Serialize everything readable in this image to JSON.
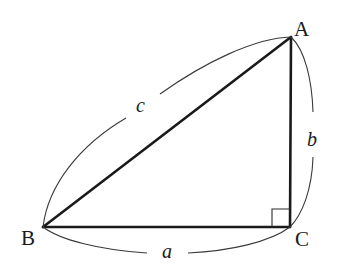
{
  "diagram": {
    "vertices": [
      {
        "id": "A",
        "label": "A",
        "x": 291,
        "y": 37
      },
      {
        "id": "B",
        "label": "B",
        "x": 43,
        "y": 227
      },
      {
        "id": "C",
        "label": "C",
        "x": 290,
        "y": 227
      }
    ],
    "sides": [
      {
        "id": "a",
        "label": "a",
        "from": "B",
        "to": "C"
      },
      {
        "id": "b",
        "label": "b",
        "from": "C",
        "to": "A"
      },
      {
        "id": "c",
        "label": "c",
        "from": "B",
        "to": "A"
      }
    ],
    "right_angle_at": "C",
    "colors": {
      "stroke": "#1a1a1a",
      "background": "#ffffff"
    }
  }
}
